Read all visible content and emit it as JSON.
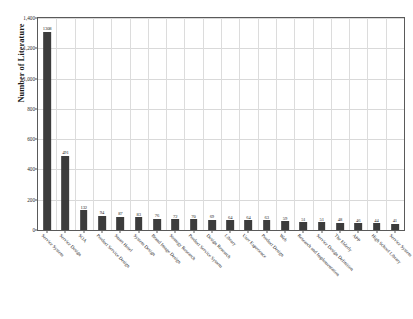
{
  "chart_data": {
    "type": "bar",
    "title": "",
    "xlabel": "",
    "ylabel": "Number of Literature",
    "ylim": [
      0,
      1400
    ],
    "yticks": [
      "0",
      "200",
      "400",
      "600",
      "800",
      "1,000",
      "1,200",
      "1,400"
    ],
    "ytick_values": [
      0,
      200,
      400,
      600,
      800,
      1000,
      1200,
      1400
    ],
    "grid": true,
    "legend": "none",
    "bar_color": "#3c3c3c",
    "categories": [
      "Service System",
      "Service Design",
      "SOA",
      "Product Service Design",
      "Smart Hotel",
      "System Design",
      "Brand Image Design",
      "Strategy Research",
      "Product Service System",
      "Design Research",
      "Library",
      "User Experience",
      "Product Design",
      "Web",
      "Research and Implementation",
      "Service Design Definition",
      "The Elderly",
      "APP",
      "High School Library",
      "Service System"
    ],
    "values": [
      1308,
      491,
      132,
      94,
      87,
      83,
      76,
      72,
      70,
      69,
      64,
      64,
      63,
      59,
      51,
      51,
      48,
      46,
      44,
      41
    ],
    "data_labels": [
      "1308",
      "491",
      "132",
      "94",
      "87",
      "83",
      "76",
      "72",
      "70",
      "69",
      "64",
      "64",
      "63",
      "59",
      "51",
      "51",
      "48",
      "46",
      "44",
      "41"
    ]
  },
  "caption": {
    "text": ""
  }
}
